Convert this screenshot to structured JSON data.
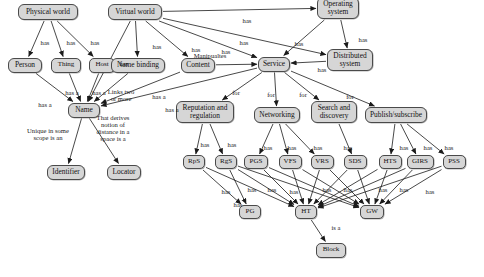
{
  "diagram": {
    "type": "concept-map",
    "style": {
      "node_fill": "#d6d6d6",
      "node_border": "#4a4a4a",
      "edge_color": "#222222",
      "background": "#ffffff",
      "text_color": "#111111"
    },
    "nodes": [
      {
        "id": "physical_world",
        "label": "Physical world",
        "x": 48,
        "y": 12,
        "w": 60,
        "h": 16
      },
      {
        "id": "virtual_world",
        "label": "Virtual world",
        "x": 135,
        "y": 12,
        "w": 54,
        "h": 16
      },
      {
        "id": "operating_system",
        "label": "Operating\nsystem",
        "x": 338,
        "y": 8,
        "w": 42,
        "h": 22
      },
      {
        "id": "person",
        "label": "Person",
        "x": 25,
        "y": 65,
        "w": 34,
        "h": 15
      },
      {
        "id": "thing",
        "label": "Thing",
        "x": 66,
        "y": 65,
        "w": 30,
        "h": 15
      },
      {
        "id": "host",
        "label": "Host",
        "x": 102,
        "y": 65,
        "w": 26,
        "h": 15
      },
      {
        "id": "name_binding",
        "label": "Name binding",
        "x": 138,
        "y": 65,
        "w": 54,
        "h": 15
      },
      {
        "id": "content",
        "label": "Content",
        "x": 198,
        "y": 65,
        "w": 34,
        "h": 15
      },
      {
        "id": "service",
        "label": "Service",
        "x": 274,
        "y": 64,
        "w": 32,
        "h": 15
      },
      {
        "id": "distributed_sys",
        "label": "Distributed\nsystem",
        "x": 350,
        "y": 60,
        "w": 46,
        "h": 22
      },
      {
        "id": "name",
        "label": "Name",
        "x": 84,
        "y": 110,
        "w": 32,
        "h": 15
      },
      {
        "id": "identifier",
        "label": "Identifier",
        "x": 66,
        "y": 172,
        "w": 38,
        "h": 15
      },
      {
        "id": "locator",
        "label": "Locator",
        "x": 124,
        "y": 172,
        "w": 34,
        "h": 15
      },
      {
        "id": "reputation",
        "label": "Reputation and\nregulation",
        "x": 205,
        "y": 112,
        "w": 58,
        "h": 22
      },
      {
        "id": "networking",
        "label": "Networking",
        "x": 277,
        "y": 115,
        "w": 46,
        "h": 16
      },
      {
        "id": "search_discovery",
        "label": "Search and\ndiscovery",
        "x": 334,
        "y": 112,
        "w": 46,
        "h": 22
      },
      {
        "id": "pubsub",
        "label": "Publish/subscribe",
        "x": 396,
        "y": 115,
        "w": 62,
        "h": 16
      },
      {
        "id": "rps",
        "label": "RpS",
        "x": 194,
        "y": 162,
        "w": 22,
        "h": 14
      },
      {
        "id": "rgs",
        "label": "RgS",
        "x": 226,
        "y": 162,
        "w": 22,
        "h": 14
      },
      {
        "id": "pgs",
        "label": "PGS",
        "x": 256,
        "y": 162,
        "w": 24,
        "h": 14
      },
      {
        "id": "vfs",
        "label": "VFS",
        "x": 290,
        "y": 162,
        "w": 23,
        "h": 14
      },
      {
        "id": "vrs",
        "label": "VRS",
        "x": 322,
        "y": 162,
        "w": 23,
        "h": 14
      },
      {
        "id": "sds",
        "label": "SDS",
        "x": 355,
        "y": 162,
        "w": 23,
        "h": 14
      },
      {
        "id": "hts",
        "label": "HTS",
        "x": 390,
        "y": 162,
        "w": 23,
        "h": 14
      },
      {
        "id": "girs",
        "label": "GIRS",
        "x": 420,
        "y": 162,
        "w": 27,
        "h": 14
      },
      {
        "id": "pss",
        "label": "PSS",
        "x": 454,
        "y": 162,
        "w": 23,
        "h": 14
      },
      {
        "id": "pg",
        "label": "PG",
        "x": 250,
        "y": 212,
        "w": 22,
        "h": 14
      },
      {
        "id": "ht",
        "label": "HT",
        "x": 306,
        "y": 212,
        "w": 22,
        "h": 14
      },
      {
        "id": "gw",
        "label": "GW",
        "x": 372,
        "y": 212,
        "w": 24,
        "h": 14
      },
      {
        "id": "block",
        "label": "Block",
        "x": 331,
        "y": 250,
        "w": 30,
        "h": 15
      }
    ],
    "edge_labels": [
      {
        "id": "l1",
        "text": "has",
        "x": 45,
        "y": 43
      },
      {
        "id": "l2",
        "text": "has",
        "x": 71,
        "y": 43
      },
      {
        "id": "l3",
        "text": "has",
        "x": 95,
        "y": 43
      },
      {
        "id": "l4",
        "text": "has",
        "x": 157,
        "y": 47
      },
      {
        "id": "l5",
        "text": "has",
        "x": 196,
        "y": 50
      },
      {
        "id": "l6",
        "text": "has",
        "x": 247,
        "y": 21
      },
      {
        "id": "l7",
        "text": "has",
        "x": 244,
        "y": 43
      },
      {
        "id": "l8",
        "text": "has",
        "x": 226,
        "y": 52
      },
      {
        "id": "l9",
        "text": "has",
        "x": 299,
        "y": 44
      },
      {
        "id": "l10",
        "text": "has",
        "x": 363,
        "y": 40
      },
      {
        "id": "l11",
        "text": "has",
        "x": 322,
        "y": 70
      },
      {
        "id": "l12",
        "text": "Manipualtes",
        "x": 210,
        "y": 56
      },
      {
        "id": "l13",
        "text": "has",
        "x": 124,
        "y": 64
      },
      {
        "id": "l14",
        "text": "has a",
        "x": 72,
        "y": 93
      },
      {
        "id": "l15",
        "text": "has a",
        "x": 99,
        "y": 93
      },
      {
        "id": "l16",
        "text": "has a",
        "x": 45,
        "y": 105
      },
      {
        "id": "l17",
        "text": "Links two\nor more",
        "x": 121,
        "y": 95
      },
      {
        "id": "l18",
        "text": "has a",
        "x": 159,
        "y": 97
      },
      {
        "id": "l19",
        "text": "has a",
        "x": 172,
        "y": 110
      },
      {
        "id": "l20",
        "text": "Unique in some\nscope is an",
        "x": 48,
        "y": 134
      },
      {
        "id": "l21",
        "text": "That derives\nnotion of\ndistance in a\nspace is a",
        "x": 113,
        "y": 128
      },
      {
        "id": "l22",
        "text": "for",
        "x": 236,
        "y": 93
      },
      {
        "id": "l23",
        "text": "for",
        "x": 271,
        "y": 95
      },
      {
        "id": "l24",
        "text": "for",
        "x": 303,
        "y": 95
      },
      {
        "id": "l25",
        "text": "for",
        "x": 350,
        "y": 97
      },
      {
        "id": "l26",
        "text": "has",
        "x": 205,
        "y": 145
      },
      {
        "id": "l27",
        "text": "has",
        "x": 232,
        "y": 145
      },
      {
        "id": "l28",
        "text": "has",
        "x": 268,
        "y": 148
      },
      {
        "id": "l29",
        "text": "has",
        "x": 292,
        "y": 148
      },
      {
        "id": "l30",
        "text": "has",
        "x": 318,
        "y": 148
      },
      {
        "id": "l31",
        "text": "has",
        "x": 348,
        "y": 148
      },
      {
        "id": "l32",
        "text": "has",
        "x": 404,
        "y": 148
      },
      {
        "id": "l33",
        "text": "has",
        "x": 428,
        "y": 148
      },
      {
        "id": "l34",
        "text": "has",
        "x": 449,
        "y": 148
      },
      {
        "id": "l35",
        "text": "has",
        "x": 226,
        "y": 192
      },
      {
        "id": "l36",
        "text": "has",
        "x": 252,
        "y": 190
      },
      {
        "id": "l37",
        "text": "has",
        "x": 272,
        "y": 190
      },
      {
        "id": "l38",
        "text": "has",
        "x": 294,
        "y": 192
      },
      {
        "id": "l39",
        "text": "has",
        "x": 327,
        "y": 190
      },
      {
        "id": "l40",
        "text": "has",
        "x": 348,
        "y": 190
      },
      {
        "id": "l41",
        "text": "has",
        "x": 383,
        "y": 190
      },
      {
        "id": "l42",
        "text": "has",
        "x": 404,
        "y": 190
      },
      {
        "id": "l43",
        "text": "has",
        "x": 430,
        "y": 192
      },
      {
        "id": "l44",
        "text": "has",
        "x": 238,
        "y": 205
      },
      {
        "id": "l45",
        "text": "is a",
        "x": 336,
        "y": 228
      }
    ],
    "edges": [
      {
        "from": "physical_world",
        "to": "person",
        "label": "has"
      },
      {
        "from": "physical_world",
        "to": "thing",
        "label": "has"
      },
      {
        "from": "physical_world",
        "to": "host",
        "label": "has"
      },
      {
        "from": "virtual_world",
        "to": "name",
        "label": "has"
      },
      {
        "from": "virtual_world",
        "to": "name_binding",
        "label": "has"
      },
      {
        "from": "virtual_world",
        "to": "content",
        "label": "has"
      },
      {
        "from": "virtual_world",
        "to": "operating_system",
        "label": "has"
      },
      {
        "from": "virtual_world",
        "to": "service",
        "label": "has"
      },
      {
        "from": "virtual_world",
        "to": "distributed_sys",
        "label": "has"
      },
      {
        "from": "operating_system",
        "to": "service",
        "label": "has"
      },
      {
        "from": "operating_system",
        "to": "distributed_sys",
        "label": "has"
      },
      {
        "from": "distributed_sys",
        "to": "service",
        "label": "has"
      },
      {
        "from": "content",
        "to": "service",
        "label": "Manipualtes"
      },
      {
        "from": "person",
        "to": "name",
        "label": "has a"
      },
      {
        "from": "thing",
        "to": "name",
        "label": "has a"
      },
      {
        "from": "host",
        "to": "name",
        "label": "has a"
      },
      {
        "from": "name_binding",
        "to": "name",
        "label": "Links two or more"
      },
      {
        "from": "content",
        "to": "name",
        "label": "has a"
      },
      {
        "from": "service",
        "to": "name",
        "label": "has a"
      },
      {
        "from": "name",
        "to": "identifier",
        "label": "Unique in some scope is an"
      },
      {
        "from": "name",
        "to": "locator",
        "label": "That derives notion of distance in a space is a"
      },
      {
        "from": "service",
        "to": "reputation",
        "label": "for"
      },
      {
        "from": "service",
        "to": "networking",
        "label": "for"
      },
      {
        "from": "service",
        "to": "search_discovery",
        "label": "for"
      },
      {
        "from": "service",
        "to": "pubsub",
        "label": "for"
      },
      {
        "from": "reputation",
        "to": "rps",
        "label": "has"
      },
      {
        "from": "reputation",
        "to": "rgs",
        "label": "has"
      },
      {
        "from": "networking",
        "to": "pgs",
        "label": "has"
      },
      {
        "from": "networking",
        "to": "vfs",
        "label": "has"
      },
      {
        "from": "networking",
        "to": "vrs",
        "label": "has"
      },
      {
        "from": "search_discovery",
        "to": "sds",
        "label": "has"
      },
      {
        "from": "pubsub",
        "to": "hts",
        "label": "has"
      },
      {
        "from": "pubsub",
        "to": "girs",
        "label": "has"
      },
      {
        "from": "pubsub",
        "to": "pss",
        "label": "has"
      },
      {
        "from": "rps",
        "to": "pg",
        "label": "has"
      },
      {
        "from": "rgs",
        "to": "pg",
        "label": "has"
      },
      {
        "from": "rps",
        "to": "ht",
        "label": "has"
      },
      {
        "from": "rgs",
        "to": "ht",
        "label": "has"
      },
      {
        "from": "pgs",
        "to": "ht",
        "label": "has"
      },
      {
        "from": "vfs",
        "to": "ht",
        "label": "has"
      },
      {
        "from": "vrs",
        "to": "ht",
        "label": "has"
      },
      {
        "from": "sds",
        "to": "ht",
        "label": "has"
      },
      {
        "from": "hts",
        "to": "ht",
        "label": "has"
      },
      {
        "from": "girs",
        "to": "ht",
        "label": "has"
      },
      {
        "from": "pss",
        "to": "ht",
        "label": "has"
      },
      {
        "from": "pgs",
        "to": "gw",
        "label": "has"
      },
      {
        "from": "vfs",
        "to": "gw",
        "label": "has"
      },
      {
        "from": "vrs",
        "to": "gw",
        "label": "has"
      },
      {
        "from": "sds",
        "to": "gw",
        "label": "has"
      },
      {
        "from": "hts",
        "to": "gw",
        "label": "has"
      },
      {
        "from": "girs",
        "to": "gw",
        "label": "has"
      },
      {
        "from": "pss",
        "to": "gw",
        "label": "has"
      },
      {
        "from": "rgs",
        "to": "gw",
        "label": "has"
      },
      {
        "from": "ht",
        "to": "block",
        "label": "is a"
      }
    ]
  }
}
